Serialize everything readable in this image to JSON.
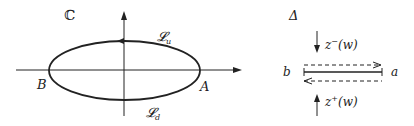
{
  "left_panel": {
    "plane_label": "ℂ",
    "contour_upper_label": "𝓛",
    "contour_upper_sub": "u",
    "contour_lower_label": "𝓛",
    "contour_lower_sub": "d",
    "point_right": "A",
    "point_left": "B"
  },
  "right_panel": {
    "delta_label": "Δ",
    "left_end": "b",
    "right_end": "a",
    "top_func": "z",
    "top_sup": "−",
    "top_arg": "(w)",
    "bottom_func": "z",
    "bottom_sup": "+",
    "bottom_arg": "(w)"
  },
  "colors": {
    "stroke": "#222222",
    "background": "#ffffff"
  }
}
